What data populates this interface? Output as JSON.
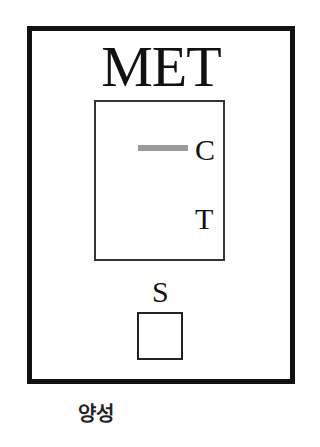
{
  "cassette": {
    "title": "MET",
    "window": {
      "control_label": "C",
      "test_label": "T",
      "control_band_visible": true,
      "test_band_visible": false,
      "band_color": "#9a9a9a"
    },
    "sample_label": "S"
  },
  "result": {
    "label": "양성"
  },
  "colors": {
    "border": "#111111",
    "background": "#ffffff"
  }
}
